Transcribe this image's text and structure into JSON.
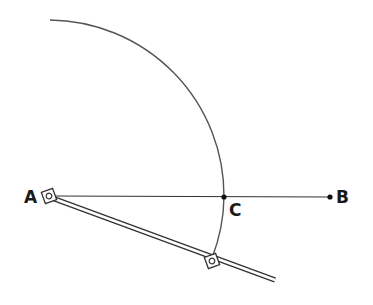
{
  "diagram": {
    "points": {
      "A": {
        "label": "A",
        "x": 49,
        "y": 196
      },
      "B": {
        "label": "B",
        "x": 330,
        "y": 197
      },
      "C": {
        "label": "C",
        "x": 224,
        "y": 197
      }
    },
    "arc": {
      "center": "A",
      "radius": 175
    },
    "colors": {
      "line": "#333333",
      "arc": "#555555"
    }
  }
}
